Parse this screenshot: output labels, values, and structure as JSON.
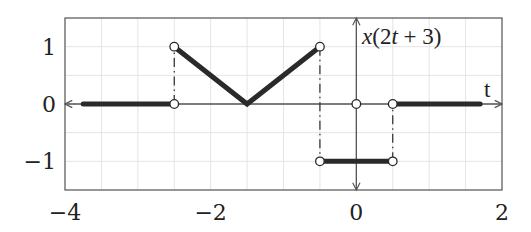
{
  "chart_data": {
    "type": "line",
    "title": "",
    "function_label": "x(2t + 3)",
    "xlabel": "t",
    "ylabel": "x(2t + 3)",
    "xlim": [
      -4,
      2
    ],
    "ylim": [
      -1.5,
      1.5
    ],
    "grid": true,
    "grid_step": {
      "x": 0.5,
      "y": 0.5
    },
    "x_ticks": [
      -4,
      -2,
      0,
      2
    ],
    "x_tick_labels": [
      "−4",
      "−2",
      "0",
      "2"
    ],
    "y_ticks": [
      -1,
      0,
      1
    ],
    "y_tick_labels": [
      "−1",
      "0",
      "1"
    ],
    "segments": [
      {
        "x": [
          -3.75,
          -2.5
        ],
        "y": [
          0,
          0
        ]
      },
      {
        "x": [
          -2.5,
          -1.5,
          -0.5
        ],
        "y": [
          1,
          0,
          1
        ]
      },
      {
        "x": [
          -0.5,
          0.5
        ],
        "y": [
          -1,
          -1
        ]
      },
      {
        "x": [
          0.5,
          1.7
        ],
        "y": [
          0,
          0
        ]
      }
    ],
    "dash_dot_jumps": [
      {
        "x": -2.5,
        "y": [
          0,
          1
        ]
      },
      {
        "x": -0.5,
        "y": [
          1,
          -1
        ]
      },
      {
        "x": 0.5,
        "y": [
          -1,
          0
        ]
      }
    ],
    "open_circles": [
      {
        "x": -2.5,
        "y": 1
      },
      {
        "x": -2.5,
        "y": 0
      },
      {
        "x": -0.5,
        "y": 1
      },
      {
        "x": -0.5,
        "y": -1
      },
      {
        "x": 0,
        "y": 0
      },
      {
        "x": 0.5,
        "y": -1
      },
      {
        "x": 0.5,
        "y": 0
      }
    ],
    "legend": null
  },
  "colors": {
    "line": "#2a2a2a",
    "axis": "#555555",
    "grid": "#e4e4e4",
    "frame": "#666666"
  }
}
